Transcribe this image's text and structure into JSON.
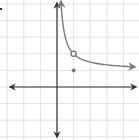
{
  "chart_data": {
    "type": "line",
    "title": "",
    "xlabel": "",
    "ylabel": "",
    "grid": true,
    "xlim": [
      -3,
      5
    ],
    "ylim": [
      -3,
      5
    ],
    "grid_step": 1,
    "series": [
      {
        "name": "f(x)",
        "description": "decreasing curve approaching horizontal asymptote y=1 and vertical asymptote x=0",
        "x": [
          0.24,
          0.3,
          0.4,
          0.5,
          0.75,
          1,
          1.5,
          2,
          3,
          4,
          4.7
        ],
        "y": [
          5.1,
          4.33,
          3.5,
          3.0,
          2.33,
          2.0,
          1.67,
          1.5,
          1.33,
          1.25,
          1.2
        ]
      }
    ],
    "annotations": [
      {
        "type": "open-circle",
        "x": 1,
        "y": 2,
        "label": "hole"
      },
      {
        "type": "filled-point",
        "x": 1,
        "y": 1,
        "label": "point"
      }
    ]
  },
  "colors": {
    "grid": "#e3e3e3",
    "axis": "#333333",
    "curve": "#7a7a7a"
  }
}
